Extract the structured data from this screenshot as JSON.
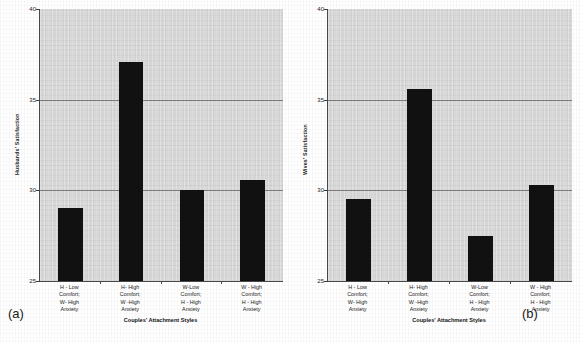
{
  "figure": {
    "background_color": "#ffffff",
    "plot_background_color": "#d9d9d9",
    "bar_color": "#111111",
    "gridline_color": "#6d6d6d",
    "axis_color": "#4a4a4a"
  },
  "panels": [
    {
      "tag": "(a)",
      "ylabel": "Husbands' Satisfaction",
      "xlabel": "Couples' Attachment Styles"
    },
    {
      "tag": "(b)",
      "ylabel": "Wives' Satisfaction",
      "xlabel": "Couples' Attachment Styles"
    }
  ],
  "category_labels": [
    [
      "H - Low",
      "Comfort;",
      "W- High",
      "Anxiety"
    ],
    [
      "H- High",
      "Comfort;",
      "W -High",
      "Anxiety"
    ],
    [
      "W-Low",
      "Comfort;",
      "H - High",
      "Anxiety"
    ],
    [
      "W - High",
      "Comfort;",
      "H - High",
      "Anxiety"
    ]
  ],
  "yticks": [
    "40",
    "35",
    "30",
    "25"
  ],
  "chart_data": [
    {
      "type": "bar",
      "title": "",
      "panel": "(a)",
      "categories": [
        "H - Low Comfort; W- High Anxiety",
        "H- High Comfort; W -High Anxiety",
        "W-Low Comfort; H - High Anxiety",
        "W - High Comfort; H - High Anxiety"
      ],
      "values": [
        29.0,
        37.1,
        30.0,
        30.55
      ],
      "xlabel": "Couples' Attachment Styles",
      "ylabel": "Husbands' Satisfaction",
      "ylim": [
        25,
        40
      ],
      "yticks": [
        25,
        30,
        35,
        40
      ],
      "gridlines": [
        30,
        35
      ],
      "grid": true,
      "legend": false
    },
    {
      "type": "bar",
      "title": "",
      "panel": "(b)",
      "categories": [
        "H - Low Comfort; W- High Anxiety",
        "H- High Comfort; W -High Anxiety",
        "W-Low Comfort; H - High Anxiety",
        "W - High Comfort; H - High Anxiety"
      ],
      "values": [
        29.5,
        35.6,
        27.5,
        30.3
      ],
      "xlabel": "Couples' Attachment Styles",
      "ylabel": "Wives' Satisfaction",
      "ylim": [
        25,
        40
      ],
      "yticks": [
        25,
        30,
        35,
        40
      ],
      "gridlines": [
        30,
        35
      ],
      "grid": true,
      "legend": false
    }
  ]
}
